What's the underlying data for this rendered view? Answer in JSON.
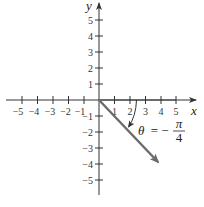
{
  "diagram": {
    "type": "coordinate-plane-angle",
    "x_axis": {
      "label": "x",
      "ticks": [
        -5,
        -4,
        -3,
        -2,
        -1,
        1,
        2,
        3,
        4,
        5
      ],
      "tick_labels": [
        "−5",
        "−4",
        "−3",
        "−2",
        "−1",
        "1",
        "2",
        "3",
        "4",
        "5"
      ]
    },
    "y_axis": {
      "label": "y",
      "ticks": [
        5,
        4,
        3,
        2,
        1,
        -1,
        -2,
        -3,
        -4,
        -5
      ],
      "tick_labels": [
        "5",
        "4",
        "3",
        "2",
        "1",
        "−1",
        "−2",
        "−3",
        "−4",
        "−5"
      ]
    },
    "initial_side": "positive x-axis",
    "terminal_side_direction": "fourth quadrant, 45° below x-axis",
    "angle": {
      "symbol": "θ",
      "equals": "= −",
      "numerator": "π",
      "denominator": "4",
      "full_text": "θ = −π/4",
      "rotation": "clockwise"
    },
    "colors": {
      "axes": "#333333",
      "ray": "#6b6b6b",
      "initial_side": "#6b6b6b",
      "text": "#222222"
    }
  }
}
